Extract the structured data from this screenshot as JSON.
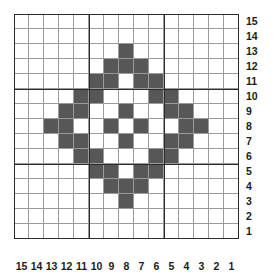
{
  "figure": {
    "kind": "pixel-grid-pattern",
    "grid_columns": 15,
    "grid_rows": 15,
    "cell_size_px": 15,
    "fill_color": "#575757",
    "empty_color": "#ffffff",
    "minor_gridline_color": "#9a9a9a",
    "major_gridline_color": "#2b2b2b",
    "major_gridline_interval": 5
  },
  "axes": {
    "column_labels": [
      "15",
      "14",
      "13",
      "12",
      "11",
      "10",
      "9",
      "8",
      "7",
      "6",
      "5",
      "4",
      "3",
      "2",
      "1"
    ],
    "row_labels": [
      "15",
      "14",
      "13",
      "12",
      "11",
      "10",
      "9",
      "8",
      "7",
      "6",
      "5",
      "4",
      "3",
      "2",
      "1"
    ],
    "column_labels_position": "bottom",
    "row_labels_position": "right"
  },
  "chart_data": {
    "type": "heatmap",
    "title": "",
    "xlabel": "",
    "ylabel": "",
    "categories": [
      "15",
      "14",
      "13",
      "12",
      "11",
      "10",
      "9",
      "8",
      "7",
      "6",
      "5",
      "4",
      "3",
      "2",
      "1"
    ],
    "row_categories": [
      "15",
      "14",
      "13",
      "12",
      "11",
      "10",
      "9",
      "8",
      "7",
      "6",
      "5",
      "4",
      "3",
      "2",
      "1"
    ],
    "values": [
      [
        0,
        0,
        0,
        0,
        0,
        0,
        0,
        0,
        0,
        0,
        0,
        0,
        0,
        0,
        0
      ],
      [
        0,
        0,
        0,
        0,
        0,
        0,
        0,
        0,
        0,
        0,
        0,
        0,
        0,
        0,
        0
      ],
      [
        0,
        0,
        0,
        0,
        0,
        0,
        0,
        1,
        0,
        0,
        0,
        0,
        0,
        0,
        0
      ],
      [
        0,
        0,
        0,
        0,
        0,
        0,
        1,
        1,
        1,
        0,
        0,
        0,
        0,
        0,
        0
      ],
      [
        0,
        0,
        0,
        0,
        0,
        1,
        1,
        0,
        1,
        1,
        0,
        0,
        0,
        0,
        0
      ],
      [
        0,
        0,
        0,
        0,
        1,
        1,
        0,
        0,
        0,
        1,
        1,
        0,
        0,
        0,
        0
      ],
      [
        0,
        0,
        0,
        1,
        1,
        0,
        0,
        1,
        0,
        0,
        1,
        1,
        0,
        0,
        0
      ],
      [
        0,
        0,
        1,
        1,
        0,
        0,
        1,
        0,
        1,
        0,
        0,
        1,
        1,
        0,
        0
      ],
      [
        0,
        0,
        0,
        1,
        1,
        0,
        0,
        1,
        0,
        0,
        1,
        1,
        0,
        0,
        0
      ],
      [
        0,
        0,
        0,
        0,
        1,
        1,
        0,
        0,
        0,
        1,
        1,
        0,
        0,
        0,
        0
      ],
      [
        0,
        0,
        0,
        0,
        0,
        1,
        1,
        0,
        1,
        1,
        0,
        0,
        0,
        0,
        0
      ],
      [
        0,
        0,
        0,
        0,
        0,
        0,
        1,
        1,
        1,
        0,
        0,
        0,
        0,
        0,
        0
      ],
      [
        0,
        0,
        0,
        0,
        0,
        0,
        0,
        1,
        0,
        0,
        0,
        0,
        0,
        0,
        0
      ],
      [
        0,
        0,
        0,
        0,
        0,
        0,
        0,
        0,
        0,
        0,
        0,
        0,
        0,
        0,
        0
      ],
      [
        0,
        0,
        0,
        0,
        0,
        0,
        0,
        0,
        0,
        0,
        0,
        0,
        0,
        0,
        0
      ]
    ],
    "grid": true,
    "legend": "none"
  }
}
